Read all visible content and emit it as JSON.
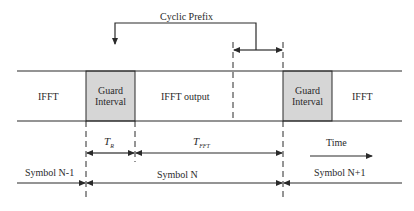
{
  "colors": {
    "line": "#2a2a2a",
    "guard_fill": "#d6d6d6",
    "background": "#ffffff"
  },
  "labels": {
    "cyclic_prefix": "Cyclic Prefix",
    "ifft_left": "IFFT",
    "guard_interval_1_line1": "Guard",
    "guard_interval_1_line2": "Interval",
    "ifft_output": "IFFT output",
    "guard_interval_2_line1": "Guard",
    "guard_interval_2_line2": "Interval",
    "ifft_right": "IFFT",
    "t_r_main": "T",
    "t_r_sub": "R",
    "t_fft_main": "T",
    "t_fft_sub": "FFT",
    "time": "Time",
    "symbol_prev": "Symbol N-1",
    "symbol_curr": "Symbol N",
    "symbol_next": "Symbol N+1"
  }
}
